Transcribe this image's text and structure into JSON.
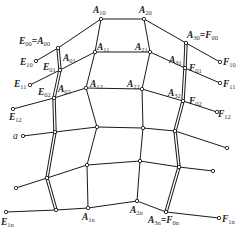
{
  "figure": {
    "caption": "",
    "nodes": {
      "E00_A00": {
        "x": 58,
        "y": 48
      },
      "A10": {
        "x": 101,
        "y": 19
      },
      "A20": {
        "x": 144,
        "y": 19
      },
      "A30_F00": {
        "x": 186,
        "y": 43
      },
      "E01_A01": {
        "x": 60,
        "y": 70
      },
      "A11": {
        "x": 95,
        "y": 52
      },
      "A21": {
        "x": 150,
        "y": 52
      },
      "A31_F01": {
        "x": 185,
        "y": 68
      },
      "E02_A02": {
        "x": 54,
        "y": 98
      },
      "A12": {
        "x": 86,
        "y": 88
      },
      "A22": {
        "x": 142,
        "y": 89
      },
      "A32_F02": {
        "x": 183,
        "y": 101
      },
      "L3": {
        "x": 55,
        "y": 132
      },
      "A13": {
        "x": 97,
        "y": 127
      },
      "A23": {
        "x": 143,
        "y": 128
      },
      "R3": {
        "x": 175,
        "y": 131
      },
      "L4": {
        "x": 47,
        "y": 178
      },
      "A14": {
        "x": 87,
        "y": 165
      },
      "A24": {
        "x": 140,
        "y": 161
      },
      "R4": {
        "x": 179,
        "y": 167
      },
      "Ln": {
        "x": 56,
        "y": 210
      },
      "A1n": {
        "x": 88,
        "y": 208
      },
      "A2n": {
        "x": 137,
        "y": 201
      },
      "A3n_F0n": {
        "x": 166,
        "y": 212
      },
      "E10": {
        "x": 36,
        "y": 61
      },
      "E11": {
        "x": 30,
        "y": 85
      },
      "E12": {
        "x": 13,
        "y": 109
      },
      "a": {
        "x": 23,
        "y": 136
      },
      "E_row4": {
        "x": 16,
        "y": 188
      },
      "E1n": {
        "x": 6,
        "y": 212
      },
      "F10": {
        "x": 220,
        "y": 62
      },
      "F11": {
        "x": 220,
        "y": 83
      },
      "F12": {
        "x": 217,
        "y": 112
      },
      "F_row3": {
        "x": 227,
        "y": 148
      },
      "F_row4": {
        "x": 213,
        "y": 171
      },
      "F1n": {
        "x": 219,
        "y": 218
      }
    },
    "labels": [
      {
        "id": "E00=A00",
        "main": "E",
        "sub": "00",
        "eq": "=A",
        "sub2": "00",
        "x": 19,
        "y": 44
      },
      {
        "id": "A10",
        "main": "A",
        "sub": "10",
        "x": 93,
        "y": 13
      },
      {
        "id": "A20",
        "main": "A",
        "sub": "20",
        "x": 139,
        "y": 13
      },
      {
        "id": "A30=F00",
        "main": "A",
        "sub": "30",
        "eq": "=F",
        "sub2": "00",
        "x": 187,
        "y": 38
      },
      {
        "id": "E10",
        "main": "E",
        "sub": "10",
        "x": 20,
        "y": 65
      },
      {
        "id": "E01",
        "main": "E",
        "sub": "01",
        "x": 43,
        "y": 70
      },
      {
        "id": "A01",
        "main": "A",
        "sub": "01",
        "x": 63,
        "y": 61
      },
      {
        "id": "A11",
        "main": "A",
        "sub": "11",
        "x": 97,
        "y": 50
      },
      {
        "id": "A21",
        "main": "A",
        "sub": "21",
        "x": 135,
        "y": 50
      },
      {
        "id": "A31",
        "main": "A",
        "sub": "31",
        "x": 169,
        "y": 63
      },
      {
        "id": "F01",
        "main": "F",
        "sub": "01",
        "x": 189,
        "y": 71
      },
      {
        "id": "F10",
        "main": "F",
        "sub": "10",
        "x": 223,
        "y": 65
      },
      {
        "id": "E11",
        "main": "E",
        "sub": "11",
        "x": 14,
        "y": 87
      },
      {
        "id": "F11",
        "main": "F",
        "sub": "11",
        "x": 223,
        "y": 87
      },
      {
        "id": "E02",
        "main": "E",
        "sub": "02",
        "x": 38,
        "y": 95
      },
      {
        "id": "A02",
        "main": "A",
        "sub": "02",
        "x": 58,
        "y": 92
      },
      {
        "id": "A12",
        "main": "A",
        "sub": "12",
        "x": 90,
        "y": 87
      },
      {
        "id": "A22",
        "main": "A",
        "sub": "22",
        "x": 127,
        "y": 87
      },
      {
        "id": "A32",
        "main": "A",
        "sub": "32",
        "x": 168,
        "y": 96
      },
      {
        "id": "F02",
        "main": "F",
        "sub": "02",
        "x": 189,
        "y": 104
      },
      {
        "id": "E12",
        "main": "E",
        "sub": "12",
        "x": 9,
        "y": 120
      },
      {
        "id": "F12",
        "main": "F",
        "sub": "12",
        "x": 218,
        "y": 117
      },
      {
        "id": "a",
        "main": "a",
        "x": 13,
        "y": 139,
        "plain": true
      },
      {
        "id": "E1n",
        "main": "E",
        "sub": "1n",
        "x": 1,
        "y": 225
      },
      {
        "id": "A1n",
        "main": "A",
        "sub": "1n",
        "x": 82,
        "y": 220
      },
      {
        "id": "A2n",
        "main": "A",
        "sub": "2n",
        "x": 130,
        "y": 213
      },
      {
        "id": "A3n=F0n",
        "main": "A",
        "sub": "3n",
        "eq": "=F",
        "sub2": "0n",
        "x": 148,
        "y": 223
      },
      {
        "id": "F1n",
        "main": "F",
        "sub": "1n",
        "x": 222,
        "y": 222
      }
    ]
  }
}
